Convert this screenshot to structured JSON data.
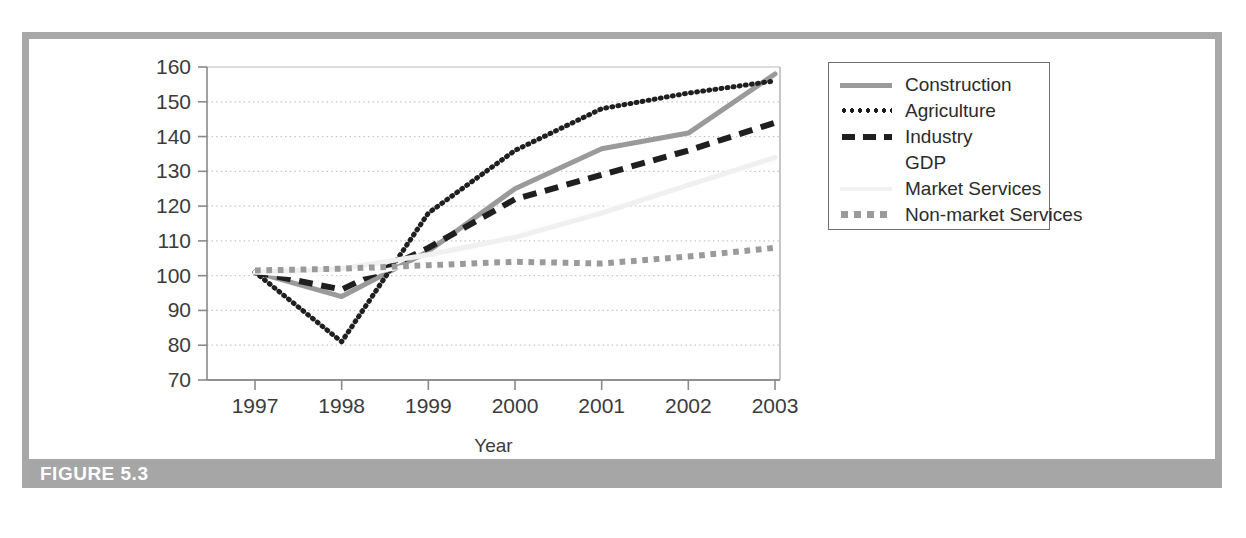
{
  "figure": {
    "caption": "FIGURE 5.3"
  },
  "chart_data": {
    "type": "line",
    "title": "",
    "xlabel": "Year",
    "ylabel": "",
    "categories": [
      "1997",
      "1998",
      "1999",
      "2000",
      "2001",
      "2002",
      "2003"
    ],
    "x": [
      1997,
      1998,
      1999,
      2000,
      2001,
      2002,
      2003
    ],
    "xtick_labels": [
      "1997",
      "1998",
      "1999",
      "2000",
      "2001",
      "2002",
      "2003"
    ],
    "ytick_labels": [
      "70",
      "80",
      "90",
      "100",
      "110",
      "120",
      "130",
      "140",
      "150",
      "160"
    ],
    "yticks": [
      70,
      80,
      90,
      100,
      110,
      120,
      130,
      140,
      150,
      160
    ],
    "ylim": [
      70,
      160
    ],
    "xlim": [
      1996.6,
      2003.4
    ],
    "grid": true,
    "grid_style": "dotted-horizontal",
    "legend_position": "outside-right-top",
    "series": [
      {
        "name": "Construction",
        "values": [
          101,
          94,
          107,
          125,
          136.5,
          141,
          158
        ],
        "style": "solid",
        "color": "#9a9a9a",
        "width": 5
      },
      {
        "name": "Agriculture",
        "values": [
          101,
          81,
          118,
          136,
          148,
          152.5,
          156
        ],
        "style": "dotted",
        "color": "#1f1f1f",
        "width": 5
      },
      {
        "name": "Industry",
        "values": [
          101,
          96,
          108,
          122,
          129,
          136,
          144
        ],
        "style": "dashed",
        "color": "#1f1f1f",
        "width": 6
      },
      {
        "name": "GDP",
        "values": [
          101,
          99,
          104,
          112,
          119,
          126,
          133
        ],
        "style": "solid",
        "color": "#fdfdfd",
        "width": 4
      },
      {
        "name": "Market Services",
        "values": [
          101,
          102,
          106,
          111,
          118,
          126,
          134
        ],
        "style": "solid",
        "color": "#f0f0f0",
        "width": 5
      },
      {
        "name": "Non-market Services",
        "values": [
          101.5,
          102,
          103,
          104,
          103.5,
          105.5,
          108
        ],
        "style": "square-dotted",
        "color": "#9a9a9a",
        "width": 6
      }
    ]
  },
  "legend": {
    "entries": [
      {
        "label": "Construction",
        "swatch": "solid-gray-line-swatch"
      },
      {
        "label": "Agriculture",
        "swatch": "dotted-black-line-swatch"
      },
      {
        "label": "Industry",
        "swatch": "dashed-black-line-swatch"
      },
      {
        "label": "GDP",
        "swatch": "blank-line-swatch"
      },
      {
        "label": "Market Services",
        "swatch": "light-gray-line-swatch"
      },
      {
        "label": "Non-market Services",
        "swatch": "square-dotted-gray-line-swatch"
      }
    ]
  },
  "colors": {
    "frame": "#a8a8a8",
    "caption_bar": "#a6a6a6",
    "caption_text": "#ffffff",
    "axis": "#8a8a8a",
    "tick_text": "#3b3b3b"
  }
}
